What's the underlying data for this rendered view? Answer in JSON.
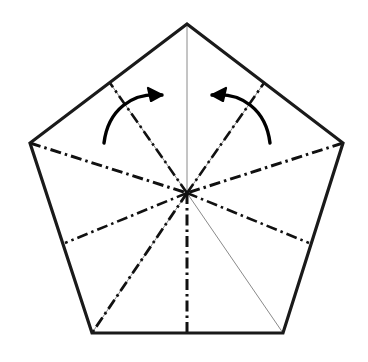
{
  "figure": {
    "type": "origami-crease-diagram",
    "width": 368,
    "height": 362,
    "background_color": "#ffffff"
  },
  "colors": {
    "outline": "#1a1a1a",
    "crease_dashdot": "#111111",
    "thin_guide": "#8a8a8a",
    "arrow": "#000000",
    "background": "#ffffff"
  },
  "geometry": {
    "center": {
      "x": 187,
      "y": 193,
      "label": "center-point"
    },
    "vertices": [
      {
        "name": "top",
        "x": 187,
        "y": 24
      },
      {
        "name": "right",
        "x": 343,
        "y": 143
      },
      {
        "name": "bottom-right",
        "x": 283,
        "y": 333
      },
      {
        "name": "bottom-left",
        "x": 92,
        "y": 333
      },
      {
        "name": "left",
        "x": 30,
        "y": 143
      }
    ],
    "edge_points": [
      {
        "name": "upper-left-edge-point",
        "x": 110,
        "y": 83
      },
      {
        "name": "upper-right-edge-point",
        "x": 264,
        "y": 83
      },
      {
        "name": "lower-left-edge-point",
        "x": 65,
        "y": 243
      },
      {
        "name": "lower-right-edge-point",
        "x": 309,
        "y": 243
      },
      {
        "name": "bottom-edge-midpoint",
        "x": 187,
        "y": 333
      }
    ]
  },
  "outline": {
    "name": "pentagon-outline",
    "points": "187,24 343,143 283,333 92,333 30,143",
    "stroke_width": 3.2
  },
  "creases": {
    "thin_guides": [
      {
        "name": "guide-top-to-center",
        "x1": 187,
        "y1": 24,
        "x2": 187,
        "y2": 193
      },
      {
        "name": "guide-bottomleft-to-center",
        "x1": 92,
        "y1": 333,
        "x2": 187,
        "y2": 193
      },
      {
        "name": "guide-bottomright-to-center",
        "x1": 283,
        "y1": 333,
        "x2": 187,
        "y2": 193
      },
      {
        "name": "guide-upperleft-edge-to-center",
        "x1": 110,
        "y1": 83,
        "x2": 187,
        "y2": 193
      },
      {
        "name": "guide-upperright-edge-to-center",
        "x1": 264,
        "y1": 83,
        "x2": 187,
        "y2": 193
      }
    ],
    "dash_dot": [
      {
        "name": "crease-left-vertex-to-center",
        "x1": 30,
        "y1": 143,
        "x2": 187,
        "y2": 193,
        "width": 3.0
      },
      {
        "name": "crease-right-vertex-to-center",
        "x1": 343,
        "y1": 143,
        "x2": 187,
        "y2": 193,
        "width": 3.0
      },
      {
        "name": "crease-center-to-bottom-midpoint",
        "x1": 187,
        "y1": 193,
        "x2": 187,
        "y2": 333,
        "width": 3.0
      },
      {
        "name": "crease-center-to-lower-left-edge",
        "x1": 187,
        "y1": 193,
        "x2": 65,
        "y2": 243,
        "width": 2.6
      },
      {
        "name": "crease-center-to-lower-right-edge",
        "x1": 187,
        "y1": 193,
        "x2": 309,
        "y2": 243,
        "width": 2.6
      },
      {
        "name": "crease-center-to-bottom-left-vertex",
        "x1": 187,
        "y1": 193,
        "x2": 92,
        "y2": 333,
        "width": 2.8
      },
      {
        "name": "crease-center-to-upper-left-edge",
        "x1": 187,
        "y1": 193,
        "x2": 110,
        "y2": 83,
        "width": 2.6
      },
      {
        "name": "crease-center-to-upper-right-edge",
        "x1": 187,
        "y1": 193,
        "x2": 264,
        "y2": 83,
        "width": 2.6
      }
    ],
    "dash_dot_pattern": "11 4 2.5 4"
  },
  "arrows": [
    {
      "name": "left-fold-arrow",
      "direction": "inward-right",
      "path": "M 104,143 C 108,110 132,92 162,95",
      "head": "M 162,95 L 148,88 L 151,101 Z",
      "stroke_width": 3.4
    },
    {
      "name": "right-fold-arrow",
      "direction": "inward-left",
      "path": "M 270,143 C 266,110 242,92 212,95",
      "head": "M 212,95 L 226,88 L 223,101 Z",
      "stroke_width": 3.4
    }
  ]
}
